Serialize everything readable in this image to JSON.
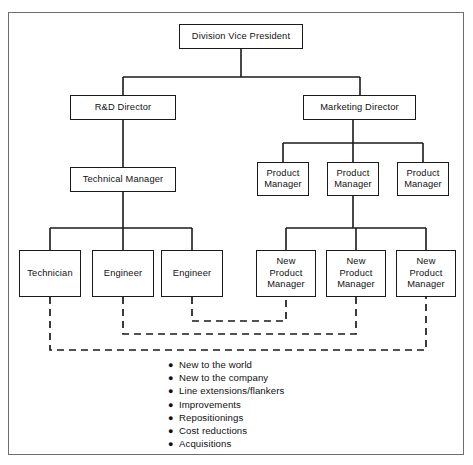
{
  "figure": {
    "kind": "organization-chart",
    "frame": {
      "border_color": "#6d6d6d"
    },
    "line_color": "#1a1a1a",
    "dashed_line_color": "#1a1a1a"
  },
  "nodes": [
    {
      "id": "division-vice-president",
      "label": "Division Vice President",
      "x": 179,
      "y": 24,
      "w": 124,
      "h": 25
    },
    {
      "id": "rd-director",
      "label": "R&D Director",
      "x": 70,
      "y": 95,
      "w": 106,
      "h": 25
    },
    {
      "id": "marketing-director",
      "label": "Marketing Director",
      "x": 303,
      "y": 95,
      "w": 113,
      "h": 25
    },
    {
      "id": "technical-manager",
      "label": "Technical Manager",
      "x": 70,
      "y": 167,
      "w": 106,
      "h": 25
    },
    {
      "id": "product-manager-1",
      "label": "Product\nManager",
      "x": 257,
      "y": 162,
      "w": 52,
      "h": 34
    },
    {
      "id": "product-manager-2",
      "label": "Product\nManager",
      "x": 327,
      "y": 162,
      "w": 52,
      "h": 34
    },
    {
      "id": "product-manager-3",
      "label": "Product\nManager",
      "x": 397,
      "y": 162,
      "w": 52,
      "h": 34
    },
    {
      "id": "technician",
      "label": "Technician",
      "x": 19,
      "y": 250,
      "w": 62,
      "h": 47
    },
    {
      "id": "engineer-1",
      "label": "Engineer",
      "x": 92,
      "y": 250,
      "w": 62,
      "h": 47
    },
    {
      "id": "engineer-2",
      "label": "Engineer",
      "x": 161,
      "y": 250,
      "w": 62,
      "h": 47
    },
    {
      "id": "new-product-manager-1",
      "label": "New\nProduct\nManager",
      "x": 256,
      "y": 250,
      "w": 60,
      "h": 47
    },
    {
      "id": "new-product-manager-2",
      "label": "New\nProduct\nManager",
      "x": 326,
      "y": 250,
      "w": 60,
      "h": 47
    },
    {
      "id": "new-product-manager-3",
      "label": "New\nProduct\nManager",
      "x": 396,
      "y": 250,
      "w": 60,
      "h": 47
    }
  ],
  "solid_connectors": [
    {
      "id": "dvp-to-trunk",
      "points": "241,49 241,77"
    },
    {
      "id": "dvp-split-bar",
      "points": "123,77 360,77"
    },
    {
      "id": "drop-to-rd",
      "points": "123,77 123,95"
    },
    {
      "id": "drop-to-marketing",
      "points": "360,77 360,95"
    },
    {
      "id": "rd-to-tech-manager",
      "points": "123,120 123,167"
    },
    {
      "id": "techmgr-trunk",
      "points": "123,192 123,228"
    },
    {
      "id": "techmgr-split-bar",
      "points": "50,228 192,228"
    },
    {
      "id": "drop-to-technician",
      "points": "50,228 50,250"
    },
    {
      "id": "drop-to-engineer-1",
      "points": "123,228 123,250"
    },
    {
      "id": "drop-to-engineer-2",
      "points": "192,228 192,250"
    },
    {
      "id": "mkt-trunk",
      "points": "353,120 353,143"
    },
    {
      "id": "mkt-split-bar",
      "points": "283,143 423,143"
    },
    {
      "id": "drop-to-pm-1",
      "points": "283,143 283,162"
    },
    {
      "id": "drop-to-pm-2",
      "points": "353,143 353,162"
    },
    {
      "id": "drop-to-pm-3",
      "points": "423,143 423,162"
    },
    {
      "id": "pm2-trunk",
      "points": "353,196 353,228"
    },
    {
      "id": "pm2-split-bar",
      "points": "286,228 426,228"
    },
    {
      "id": "drop-to-npm-1",
      "points": "286,228 286,250"
    },
    {
      "id": "drop-to-npm-2",
      "points": "356,228 356,250"
    },
    {
      "id": "drop-to-npm-3",
      "points": "426,228 426,250"
    }
  ],
  "dashed_connectors": [
    {
      "id": "engineer2-to-npm1",
      "points": "192,297 192,321 286,321 286,297"
    },
    {
      "id": "engineer1-to-npm2",
      "points": "123,297 123,334 356,334 356,297"
    },
    {
      "id": "technician-to-npm3",
      "points": "50,297 50,350 426,350 426,297"
    }
  ],
  "bullets": {
    "marker": "●",
    "items": [
      "New to the world",
      "New to the company",
      "Line extensions/flankers",
      "Improvements",
      "Repositionings",
      "Cost reductions",
      "Acquisitions"
    ]
  }
}
